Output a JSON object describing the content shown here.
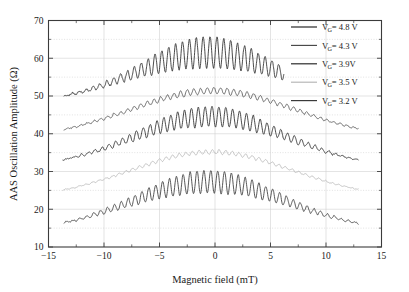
{
  "chart_data": {
    "type": "line",
    "title": "",
    "xlabel": "Magnetic field (mT)",
    "ylabel": "AAS Oscillation Amplitude (Ω)",
    "xlim": [
      -15,
      15
    ],
    "ylim": [
      10,
      70
    ],
    "xticks": [
      -15,
      -10,
      -5,
      0,
      5,
      10,
      15
    ],
    "xticklabels": [
      "−15",
      "−10",
      "−5",
      "0",
      "5",
      "10",
      "15"
    ],
    "yticks": [
      10,
      20,
      30,
      40,
      50,
      60,
      70
    ],
    "yticklabels": [
      "10",
      "20",
      "30",
      "40",
      "50",
      "60",
      "70"
    ],
    "xminor": [
      -12.5,
      -7.5,
      -2.5,
      2.5,
      7.5,
      12.5
    ],
    "yminor": [
      15,
      25,
      35,
      45,
      55,
      65
    ],
    "grid": true,
    "legend_position": "top-right",
    "series": [
      {
        "name": "V_G= 4.8 V",
        "label_main": "V",
        "label_sub": "G",
        "label_rest": "= 4.8 V",
        "color": "#2b2b2b",
        "linewidth": 0.85,
        "x_start": -13.6,
        "x_end": 6.2,
        "baseline_peak": 61.5,
        "baseline_center": -0.6,
        "baseline_width": 9.2,
        "baseline_floor": 48.3,
        "osc_amp_peak": 4.2,
        "osc_period": 0.62,
        "osc_phase": 0.0,
        "osc_envelope_width": 7.2,
        "noise_amp": 0.42,
        "seed": 11
      },
      {
        "name": "V_G= 4.3 V",
        "label_main": "V",
        "label_sub": "G",
        "label_rest": "= 4.3 V",
        "color": "#4a4a4a",
        "linewidth": 0.8,
        "x_start": -13.6,
        "x_end": 12.9,
        "baseline_peak": 51.4,
        "baseline_center": -0.2,
        "baseline_width": 10.5,
        "baseline_floor": 38.7,
        "osc_amp_peak": 0.82,
        "osc_period": 0.6,
        "osc_phase": 0.5,
        "osc_envelope_width": 10.5,
        "noise_amp": 0.3,
        "seed": 23
      },
      {
        "name": "V_G= 3.9V",
        "label_main": "V",
        "label_sub": "G",
        "label_rest": "= 3.9V",
        "color": "#2b2b2b",
        "linewidth": 0.85,
        "x_start": -13.7,
        "x_end": 12.9,
        "baseline_peak": 44.6,
        "baseline_center": -0.4,
        "baseline_width": 9.6,
        "baseline_floor": 31.2,
        "osc_amp_peak": 2.7,
        "osc_period": 0.62,
        "osc_phase": 0.2,
        "osc_envelope_width": 7.6,
        "noise_amp": 0.35,
        "seed": 37
      },
      {
        "name": "V_G= 3.5 V",
        "label_main": "V",
        "label_sub": "G",
        "label_rest": "= 3.5 V",
        "color": "#b4b4b4",
        "linewidth": 0.8,
        "x_start": -13.7,
        "x_end": 12.9,
        "baseline_peak": 35.2,
        "baseline_center": -0.3,
        "baseline_width": 10.2,
        "baseline_floor": 23.0,
        "osc_amp_peak": 0.55,
        "osc_period": 0.6,
        "osc_phase": 0.8,
        "osc_envelope_width": 10.0,
        "noise_amp": 0.22,
        "seed": 53
      },
      {
        "name": "V_G= 3.2 V",
        "label_main": "V",
        "label_sub": "G",
        "label_rest": "= 3.2 V",
        "color": "#3a3a3a",
        "linewidth": 0.85,
        "x_start": -13.6,
        "x_end": 12.9,
        "baseline_peak": 27.3,
        "baseline_center": -0.5,
        "baseline_width": 9.8,
        "baseline_floor": 14.3,
        "osc_amp_peak": 3.0,
        "osc_period": 0.62,
        "osc_phase": 0.35,
        "osc_envelope_width": 7.8,
        "noise_amp": 0.33,
        "seed": 71
      }
    ]
  },
  "legend": {
    "entries": [
      {
        "text": "V_G= 4.8 V",
        "color": "#2b2b2b"
      },
      {
        "text": "V_G= 4.3 V",
        "color": "#4a4a4a"
      },
      {
        "text": "V_G= 3.9V",
        "color": "#2b2b2b"
      },
      {
        "text": "V_G= 3.5 V",
        "color": "#b4b4b4"
      },
      {
        "text": "V_G= 3.2 V",
        "color": "#3a3a3a"
      }
    ]
  },
  "colors": {
    "frame": "#3b3b3b",
    "grid": "#d2d2d2",
    "text": "#1a1a1a",
    "background": "#ffffff"
  }
}
